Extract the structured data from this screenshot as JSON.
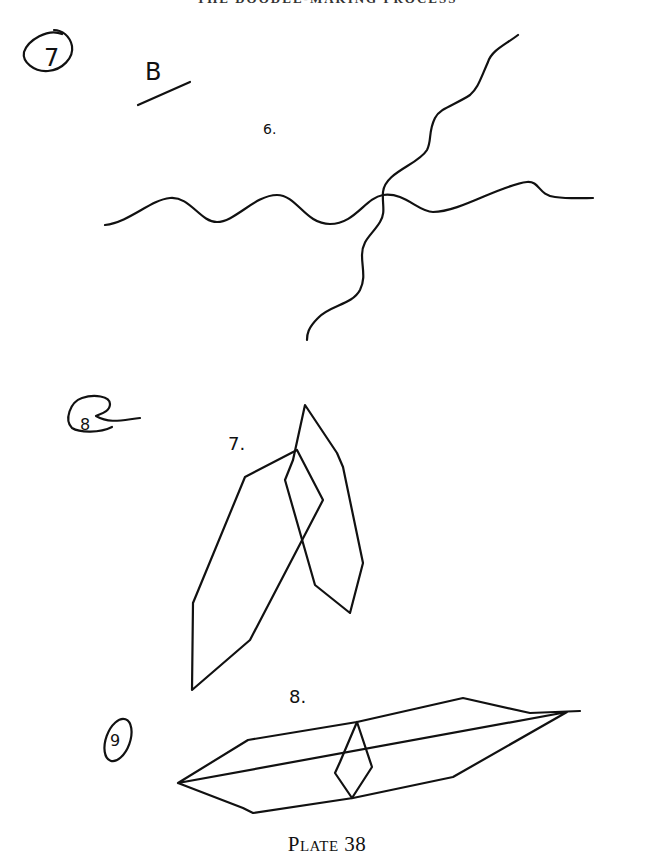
{
  "page": {
    "running_head": "THE DOODLE-MAKING PROCESS",
    "caption": "Plate 38"
  },
  "figures": [
    {
      "annotation_circle": "7",
      "annotation_letter": "B",
      "figure_label": "6.",
      "description": "two crossing wavy lines"
    },
    {
      "annotation_circle": "8",
      "figure_label": "7.",
      "description": "two overlapping elongated polygons"
    },
    {
      "annotation_circle": "9",
      "figure_label": "8.",
      "description": "long horizontal polygon with small inner diamond"
    }
  ],
  "colors": {
    "ink": "#111111",
    "paper": "#ffffff"
  }
}
